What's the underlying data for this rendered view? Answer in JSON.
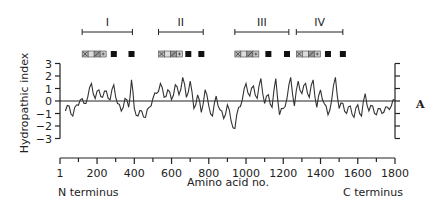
{
  "chart_data": {
    "type": "line",
    "title": "",
    "xlabel": "Amino acid no.",
    "ylabel": "Hydropathic index",
    "xlim": [
      1,
      1800
    ],
    "ylim": [
      -3,
      3
    ],
    "x_ticks": [
      "1",
      "200",
      "400",
      "600",
      "800",
      "1000",
      "1200",
      "1400",
      "1600",
      "1800"
    ],
    "y_ticks": [
      "3",
      "2",
      "1",
      "0",
      "-1",
      "-2",
      "-3"
    ],
    "x_end_labels": {
      "left": "N terminus",
      "right": "C terminus"
    },
    "panel_label": "A",
    "grid": false,
    "domains": [
      {
        "label": "I",
        "start": 120,
        "end": 390
      },
      {
        "label": "II",
        "start": 530,
        "end": 770
      },
      {
        "label": "III",
        "start": 940,
        "end": 1230
      },
      {
        "label": "IV",
        "start": 1270,
        "end": 1520
      }
    ],
    "segment_markers": [
      {
        "domain": "I",
        "pattern_block_start": 120,
        "black_boxes": [
          290,
          385
        ]
      },
      {
        "domain": "II",
        "pattern_block_start": 530,
        "black_boxes": [
          690,
          760
        ]
      },
      {
        "domain": "III",
        "pattern_block_start": 940,
        "black_boxes": [
          1120,
          1220
        ]
      },
      {
        "domain": "IV",
        "pattern_block_start": 1270,
        "black_boxes": [
          1440,
          1520
        ]
      }
    ],
    "series": [
      {
        "name": "Hydropathic index",
        "x": [
          30,
          50,
          70,
          90,
          110,
          130,
          150,
          170,
          190,
          210,
          230,
          250,
          270,
          290,
          310,
          330,
          350,
          370,
          385,
          400,
          420,
          440,
          460,
          480,
          500,
          520,
          540,
          560,
          580,
          600,
          620,
          640,
          660,
          680,
          700,
          720,
          740,
          760,
          780,
          800,
          820,
          840,
          860,
          880,
          900,
          920,
          940,
          960,
          980,
          1000,
          1020,
          1040,
          1060,
          1080,
          1100,
          1120,
          1140,
          1160,
          1180,
          1200,
          1220,
          1240,
          1260,
          1280,
          1300,
          1320,
          1340,
          1360,
          1380,
          1400,
          1420,
          1440,
          1460,
          1480,
          1500,
          1520,
          1540,
          1560,
          1580,
          1600,
          1620,
          1640,
          1660,
          1680,
          1700,
          1720,
          1740,
          1760,
          1780,
          1800
        ],
        "values": [
          -0.8,
          -0.4,
          -1.2,
          -0.3,
          0.1,
          -0.2,
          0.3,
          1.4,
          0.2,
          0.9,
          0.3,
          0.8,
          0.1,
          1.3,
          -0.2,
          -0.8,
          0.2,
          -0.5,
          1.7,
          -0.6,
          -1.2,
          -0.8,
          -1.3,
          -0.5,
          0.2,
          0.6,
          1.4,
          0.3,
          0.9,
          0.1,
          1.3,
          0.5,
          1.9,
          0.3,
          1.6,
          -0.6,
          0.5,
          -0.9,
          0.9,
          -0.4,
          -1.2,
          0.4,
          -0.7,
          -1.4,
          -0.3,
          -1.6,
          -2.2,
          -0.5,
          0.1,
          1.4,
          0.4,
          1.2,
          0.2,
          1.8,
          -0.2,
          0.5,
          -0.5,
          1.8,
          -1.1,
          -0.6,
          0.2,
          1.9,
          -0.4,
          1.6,
          0.6,
          1.4,
          0.3,
          1.7,
          -0.5,
          0.9,
          -0.2,
          -1.1,
          0.1,
          1.9,
          -0.6,
          -0.2,
          -1.0,
          -0.4,
          -1.3,
          -0.3,
          -1.2,
          0.6,
          -0.8,
          -0.4,
          -1.1,
          -0.6,
          -0.9,
          -0.5,
          -0.4,
          0.1
        ]
      }
    ]
  }
}
